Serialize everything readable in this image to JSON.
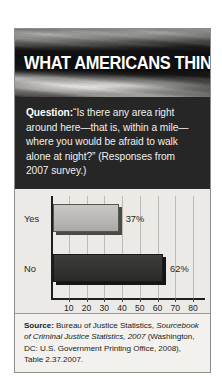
{
  "card": {
    "header": {
      "title": "WHAT AMERICANS THINK",
      "background_image": "american-flag-grayscale-photo"
    },
    "question": {
      "label": "Question:",
      "text": "“Is there any area right around here—that is, within a mile—where you would be afraid to walk alone at night?” (Responses from 2007 survey.)"
    },
    "source": {
      "label": "Source:",
      "part1": " Bureau of Justice Statistics, ",
      "italic1": "Sourcebook of Criminal Justice Statistics, 2007",
      "part2": " (Washington, DC: U.S. Government Printing Office, 2008), Table 2.37.2007."
    }
  },
  "colors": {
    "card_background": "#f2f1ee",
    "header_overlay": "#141414",
    "question_background": "#262626",
    "question_text": "#f0efec",
    "chart_background": "#eceae6",
    "gridline": "#bdbbb6",
    "axis": "#1d1d1d",
    "bar_yes": "#bcbbb7",
    "bar_no": "#333332",
    "text": "#1c1c1c"
  },
  "chart_data": {
    "type": "bar",
    "orientation": "horizontal",
    "title": "",
    "xlabel": "",
    "ylabel": "",
    "categories": [
      "Yes",
      "No"
    ],
    "values": [
      37,
      62
    ],
    "value_labels": [
      "37%",
      "62%"
    ],
    "xlim": [
      0,
      80
    ],
    "xticks": [
      10,
      20,
      30,
      40,
      50,
      60,
      70,
      80
    ],
    "xtick_labels": [
      "10",
      "20",
      "30",
      "40",
      "50",
      "60",
      "70",
      "80"
    ],
    "grid": true,
    "grid_axis": "x",
    "legend": false,
    "bar_colors": [
      "#bcbbb7",
      "#333332"
    ]
  }
}
